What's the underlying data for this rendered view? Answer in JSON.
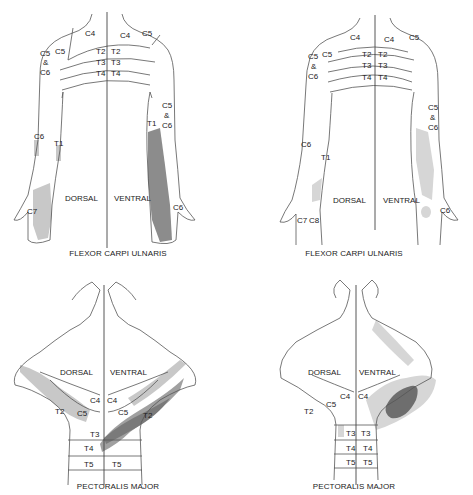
{
  "figures": [
    {
      "id": "fcu-left",
      "muscle": "FLEXOR CARPI ULNARIS",
      "side_labels": {
        "dorsal": "DORSAL",
        "ventral": "VENTRAL"
      },
      "dermatomes": {
        "c4a": "C4",
        "c4b": "C4",
        "c5a": "C5",
        "c5b": "C5",
        "c56_top_1": "C5",
        "c56_top_2": "&",
        "c56_top_3": "C6",
        "t2a": "T2",
        "t2b": "T2",
        "t3a": "T3",
        "t3b": "T3",
        "t4a": "T4",
        "t4b": "T4",
        "c6a": "C6",
        "t1a": "T1",
        "t1b": "T1",
        "c56_r_1": "C5",
        "c56_r_2": "&",
        "c56_r_3": "C6",
        "c7": "C7",
        "c6b": "C6"
      },
      "shading": {
        "light": "#c8c8c8",
        "dark": "#8c8c8c"
      }
    },
    {
      "id": "fcu-right",
      "muscle": "FLEXOR CARPI ULNARIS",
      "side_labels": {
        "dorsal": "DORSAL",
        "ventral": "VENTRAL"
      },
      "dermatomes": {
        "c4a": "C4",
        "c4b": "C4",
        "c5a": "C5",
        "c5b": "C5",
        "c56_top_1": "C5",
        "c56_top_2": "&",
        "c56_top_3": "C6",
        "t2a": "T2",
        "t2b": "T2",
        "t3a": "T3",
        "t3b": "T3",
        "t4a": "T4",
        "t4b": "T4",
        "c6a": "C6",
        "t1a": "T1",
        "c56_r_1": "C5",
        "c56_r_2": "&",
        "c56_r_3": "C6",
        "c7": "C7",
        "c8": "C8",
        "c6b": "C6"
      },
      "shading": {
        "light": "#d6d6d6"
      }
    },
    {
      "id": "pm-left",
      "muscle": "PECTORALIS MAJOR",
      "side_labels": {
        "dorsal": "DORSAL",
        "ventral": "VENTRAL"
      },
      "dermatomes": {
        "c4a": "C4",
        "c4b": "C4",
        "c5a": "C5",
        "c5b": "C5",
        "t2a": "T2",
        "t2b": "T2",
        "t3": "T3",
        "t4": "T4",
        "t5a": "T5",
        "t5b": "T5"
      },
      "shading": {
        "light": "#c8c8c8",
        "medium": "#a0a0a0",
        "dark": "#7a7a7a"
      }
    },
    {
      "id": "pm-right",
      "muscle": "PECTORALIS MAJOR",
      "side_labels": {
        "dorsal": "DORSAL",
        "ventral": "VENTRAL"
      },
      "dermatomes": {
        "c4a": "C4",
        "c4b": "C4",
        "c5": "C5",
        "t2": "T2",
        "t3a": "T3",
        "t3b": "T3",
        "t4a": "T4",
        "t4b": "T4",
        "t5a": "T5",
        "t5b": "T5"
      },
      "shading": {
        "light": "#d6d6d6",
        "medium": "#b4b4b4",
        "dark": "#6e6e6e"
      }
    }
  ]
}
